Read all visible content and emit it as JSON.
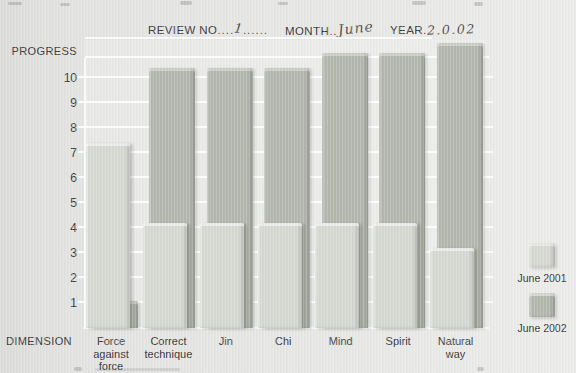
{
  "page": {
    "header": {
      "review": {
        "label": "REVIEW NO",
        "dots_left": "....",
        "value": "1",
        "dots_right": "......"
      },
      "month": {
        "label": "MONTH",
        "dots": "..",
        "value": "June"
      },
      "year": {
        "label": "YEAR",
        "dots": ".",
        "value": "2.0.02"
      }
    },
    "y_axis_title": "PROGRESS",
    "x_axis_title": "DIMENSION"
  },
  "chart_data": {
    "type": "bar",
    "categories": [
      "Force against force",
      "Correct technique",
      "Jin",
      "Chi",
      "Mind",
      "Spirit",
      "Natural way"
    ],
    "categories_display": [
      [
        "Force",
        "against force"
      ],
      [
        "Correct",
        "technique"
      ],
      [
        "Jin"
      ],
      [
        "Chi"
      ],
      [
        "Mind"
      ],
      [
        "Spirit"
      ],
      [
        "Natural",
        "way"
      ]
    ],
    "series": [
      {
        "name": "June 2001",
        "color": "#d5d7d1",
        "values": [
          7.4,
          4.2,
          4.2,
          4.2,
          4.2,
          4.2,
          3.2
        ]
      },
      {
        "name": "June 2002",
        "color": "#b2b6ac",
        "values": [
          1.1,
          10.4,
          10.4,
          10.4,
          11.0,
          11.0,
          11.4
        ]
      }
    ],
    "ylabel": "PROGRESS",
    "xlabel": "DIMENSION",
    "yticks": [
      1,
      2,
      3,
      4,
      5,
      6,
      7,
      8,
      9,
      10
    ],
    "ylim": [
      0,
      11.5
    ],
    "grid": true,
    "legend_position": "right"
  }
}
